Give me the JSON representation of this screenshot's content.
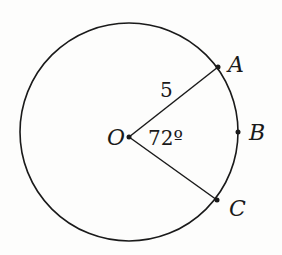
{
  "diagram": {
    "type": "circle-sector",
    "center": {
      "label": "O",
      "x": 129,
      "y": 137
    },
    "circle": {
      "cx": 129,
      "cy": 132,
      "r": 109
    },
    "points": [
      {
        "label": "A",
        "x": 218,
        "y": 67
      },
      {
        "label": "B",
        "x": 238,
        "y": 132
      },
      {
        "label": "C",
        "x": 217,
        "y": 200
      }
    ],
    "radius_label": "5",
    "angle_label": "72º",
    "colors": {
      "stroke": "#1a1a1a",
      "background": "#fdfdfc"
    }
  }
}
